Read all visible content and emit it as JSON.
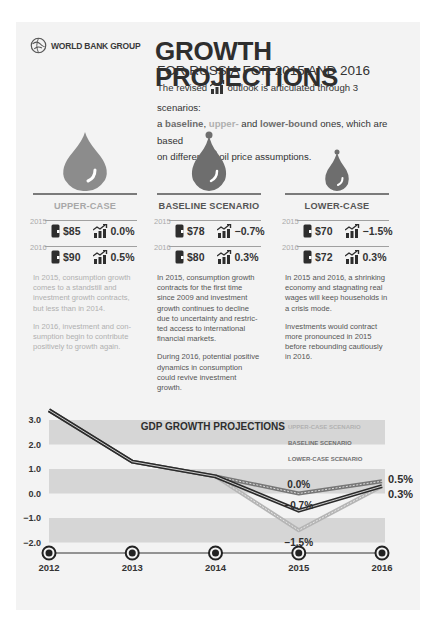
{
  "header": {
    "logo_text": "WORLD BANK GROUP",
    "title": "GROWTH PROJECTIONS",
    "subtitle": "FOR RUSSIA FOR 2015 AND 2016",
    "intro": {
      "part1": "The revised",
      "part2": "outlook is articulated through 3 scenarios:",
      "part3": "a",
      "baseline": "baseline",
      "comma": ",",
      "upper": "upper-",
      "and": "and",
      "lower": "lower-bound",
      "part4": "ones, which are based",
      "part5": "on different",
      "part6": "oil price assumptions."
    }
  },
  "scenarios": [
    {
      "name": "UPPER-CASE",
      "rows": [
        {
          "year": "2015",
          "oil_price": "$85",
          "growth": "0.0%"
        },
        {
          "year": "2016",
          "oil_price": "$90",
          "growth": "0.5%"
        }
      ],
      "paragraphs": [
        "In 2015, consumption growth comes to a standstill and investment growth contracts, but less than in 2014.",
        "In 2016, investment and con-sumption begin to contribute positively to growth again."
      ]
    },
    {
      "name": "BASELINE SCENARIO",
      "rows": [
        {
          "year": "2015",
          "oil_price": "$78",
          "growth": "−0.7%"
        },
        {
          "year": "2016",
          "oil_price": "$80",
          "growth": "0.3%"
        }
      ],
      "paragraphs": [
        "In 2015, consumption growth contracts for the first time since 2009 and investment growth continues to decline due to uncertainty and restric-ted access to international financial markets.",
        "During 2016, potential positive dynamics in consumption could revive investment growth."
      ]
    },
    {
      "name": "LOWER-CASE",
      "rows": [
        {
          "year": "2015",
          "oil_price": "$70",
          "growth": "−1.5%"
        },
        {
          "year": "2016",
          "oil_price": "$72",
          "growth": "0.3%"
        }
      ],
      "paragraphs": [
        "In 2015 and 2016, a shrinking economy and stagnating real wages will keep households in a crisis mode.",
        "Investments would contract more pronounced in 2015 before rebounding cautiously in 2016."
      ]
    }
  ],
  "colors": {
    "drop_upper": "#8c8c8c",
    "drop_baseline": "#6e6e6e",
    "drop_lower": "#6e6e6e",
    "band": "#d6d6d6",
    "line_dark": "#2a2a2a",
    "line_upper": "#777777",
    "line_lower": "#b5b5b5"
  },
  "chart_data": {
    "type": "line",
    "title": "GDP GROWTH PROJECTIONS",
    "x": [
      "2012",
      "2013",
      "2014",
      "2015",
      "2016"
    ],
    "yticks": [
      "3.0",
      "2.0",
      "1.0",
      "0.0",
      "−1.0",
      "−2.0"
    ],
    "ylim": [
      -2.0,
      3.4
    ],
    "legend": [
      "UPPER-CASE SCENARIO",
      "BASELINE SCENARIO",
      "LOWER-CASE SCENARIO"
    ],
    "legend_position": "top-right",
    "series": [
      {
        "name": "UPPER-CASE SCENARIO",
        "values": [
          3.4,
          1.3,
          0.7,
          0.0,
          0.5
        ]
      },
      {
        "name": "BASELINE SCENARIO",
        "values": [
          3.4,
          1.3,
          0.7,
          -0.7,
          0.3
        ]
      },
      {
        "name": "LOWER-CASE SCENARIO",
        "values": [
          3.4,
          1.3,
          0.7,
          -1.5,
          0.3
        ]
      }
    ],
    "annotations": [
      {
        "x": "2015",
        "label": "0.0%"
      },
      {
        "x": "2015",
        "label": "−0.7%"
      },
      {
        "x": "2015",
        "label": "−1.5%"
      },
      {
        "x": "2016",
        "label": "0.5%"
      },
      {
        "x": "2016",
        "label": "0.3%"
      }
    ]
  }
}
